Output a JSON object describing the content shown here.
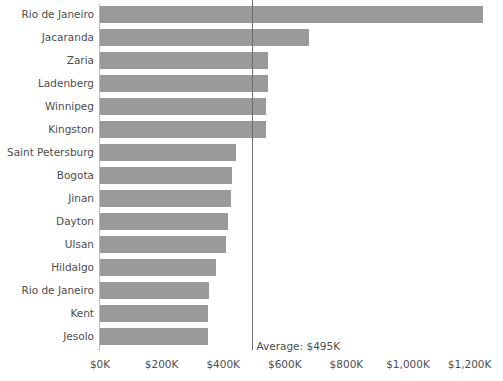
{
  "chart_data": {
    "type": "bar",
    "orientation": "horizontal",
    "title": "",
    "subtitle": "",
    "xlabel": "",
    "ylabel": "",
    "xlim": [
      0,
      1250
    ],
    "grid": false,
    "legend": null,
    "bar_color": "#9a9a9a",
    "axis_color": "#b8b8b8",
    "text_color": "#4d4d4d",
    "value_unit": "$K",
    "categories": [
      "Rio de Janeiro",
      "Jacaranda",
      "Zaria",
      "Ladenberg",
      "Winnipeg",
      "Kingston",
      "Saint Petersburg",
      "Bogota",
      "Jinan",
      "Dayton",
      "Ulsan",
      "Hildalgo",
      "Rio de Janeiro",
      "Kent",
      "Jesolo"
    ],
    "values": [
      1245,
      680,
      545,
      545,
      540,
      540,
      440,
      430,
      425,
      415,
      410,
      375,
      355,
      350,
      350
    ],
    "xticks": [
      {
        "value": 0,
        "label": "$0K"
      },
      {
        "value": 200,
        "label": "$200K"
      },
      {
        "value": 400,
        "label": "$400K"
      },
      {
        "value": 600,
        "label": "$600K"
      },
      {
        "value": 800,
        "label": "$800K"
      },
      {
        "value": 1000,
        "label": "$1,000K"
      },
      {
        "value": 1200,
        "label": "$1,200K"
      }
    ],
    "reference_line": {
      "name": "average",
      "value": 495,
      "label": "Average: $495K",
      "color": "#6f6f6f"
    }
  }
}
